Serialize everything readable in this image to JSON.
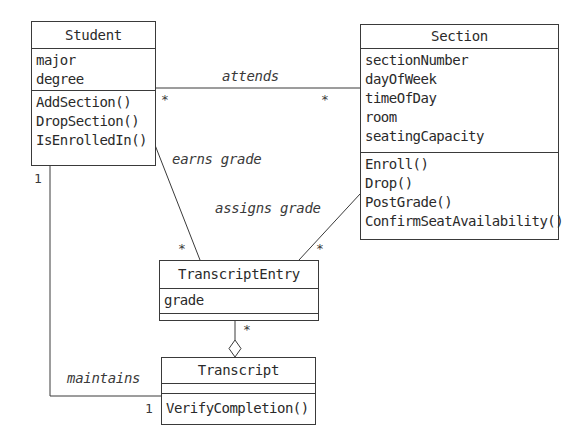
{
  "classes": {
    "student": {
      "name": "Student",
      "attributes": [
        "major",
        "degree"
      ],
      "operations": [
        "AddSection()",
        "DropSection()",
        "IsEnrolledIn()"
      ]
    },
    "section": {
      "name": "Section",
      "attributes": [
        "sectionNumber",
        "dayOfWeek",
        "timeOfDay",
        "room",
        "seatingCapacity"
      ],
      "operations": [
        "Enroll()",
        "Drop()",
        "PostGrade()",
        "ConfirmSeatAvailability()"
      ]
    },
    "transcript_entry": {
      "name": "TranscriptEntry",
      "attributes": [
        "grade"
      ],
      "operations": []
    },
    "transcript": {
      "name": "Transcript",
      "attributes": [],
      "operations": [
        "VerifyCompletion()"
      ]
    }
  },
  "associations": {
    "attends": {
      "label": "attends",
      "mult_student": "*",
      "mult_section": "*"
    },
    "earns_grade": {
      "label": "earns grade",
      "mult_entry": "*"
    },
    "assigns_grade": {
      "label": "assigns grade",
      "mult_entry": "*"
    },
    "aggregation": {
      "mult_entry": "*"
    },
    "maintains": {
      "label": "maintains",
      "mult_student": "1",
      "mult_transcript": "1"
    }
  }
}
